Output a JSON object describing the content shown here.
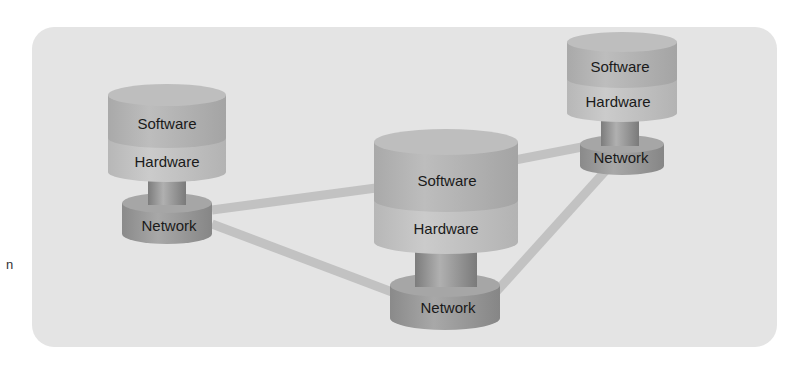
{
  "diagram": {
    "type": "network-of-systems",
    "edge_fragment_text": "n",
    "colors": {
      "panel": "#e4e4e4",
      "connector": "#bdbdbd",
      "software_layer": "#b8b8b8",
      "hardware_layer": "#c6c6c6",
      "stem": "#9a9a9a",
      "network_layer": "#9e9e9e"
    },
    "nodes": [
      {
        "id": "left",
        "software_label": "Software",
        "hardware_label": "Hardware",
        "network_label": "Network"
      },
      {
        "id": "center",
        "software_label": "Software",
        "hardware_label": "Hardware",
        "network_label": "Network"
      },
      {
        "id": "right",
        "software_label": "Software",
        "hardware_label": "Hardware",
        "network_label": "Network"
      }
    ],
    "connections": [
      {
        "from": "left",
        "to": "center"
      },
      {
        "from": "left",
        "to": "center-network"
      },
      {
        "from": "center",
        "to": "right-network"
      },
      {
        "from": "center-network",
        "to": "right-network"
      }
    ]
  }
}
